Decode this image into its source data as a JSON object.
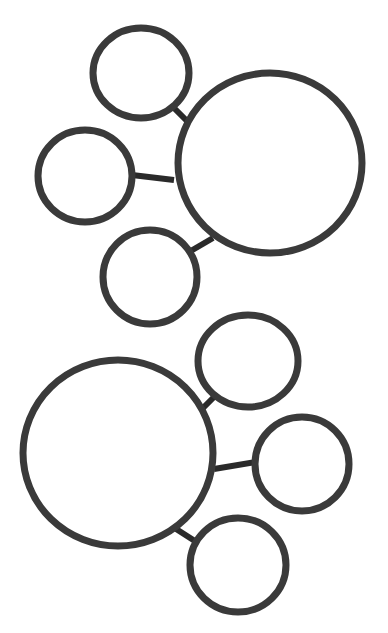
{
  "diagram": {
    "type": "bubble-map",
    "background": "#ffffff",
    "stroke_color": "#3a3a3a",
    "clusters": [
      {
        "name": "cluster-top",
        "center": {
          "cx": 270,
          "cy": 163,
          "rx": 92,
          "ry": 90
        },
        "satellites": [
          {
            "cx": 141,
            "cy": 73,
            "rx": 48,
            "ry": 45,
            "link": [
              174,
              108,
              189,
              123
            ]
          },
          {
            "cx": 85,
            "cy": 176,
            "rx": 47,
            "ry": 46,
            "link": [
              132,
              175,
              174,
              180
            ]
          },
          {
            "cx": 150,
            "cy": 277,
            "rx": 47,
            "ry": 47,
            "link": [
              189,
              252,
              213,
              238
            ]
          }
        ]
      },
      {
        "name": "cluster-bottom",
        "center": {
          "cx": 118,
          "cy": 453,
          "rx": 95,
          "ry": 93
        },
        "satellites": [
          {
            "cx": 248,
            "cy": 361,
            "rx": 50,
            "ry": 46,
            "link": [
              201,
              410,
              216,
              395
            ]
          },
          {
            "cx": 302,
            "cy": 464,
            "rx": 47,
            "ry": 47,
            "link": [
              214,
              469,
              256,
              462
            ]
          },
          {
            "cx": 238,
            "cy": 565,
            "rx": 48,
            "ry": 47,
            "link": [
              173,
              527,
              198,
              543
            ]
          }
        ]
      }
    ]
  }
}
